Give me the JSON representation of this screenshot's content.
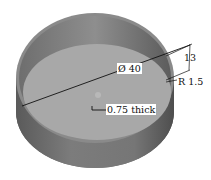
{
  "figure": {
    "colors": {
      "background": "#ffffff",
      "outer_wall": "#7a7a7a",
      "outer_wall_dark": "#5e5e5e",
      "inner_wall": "#8c8c8c",
      "floor": "#a6a6a6",
      "rim_edge": "#9a9a9a",
      "dimension_line": "#111111"
    }
  },
  "dimensions": {
    "diameter": {
      "label": "Ø 40",
      "value": 40,
      "type": "diameter"
    },
    "height": {
      "label": "13",
      "value": 13,
      "type": "linear"
    },
    "fillet_radius": {
      "label": "R 1.5",
      "value": 1.5,
      "type": "radius"
    },
    "thickness": {
      "label": "0.75 thick",
      "value": 0.75,
      "type": "thickness"
    }
  }
}
